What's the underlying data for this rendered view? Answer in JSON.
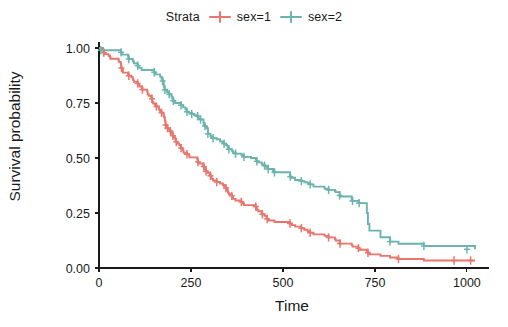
{
  "legend": {
    "title": "Strata",
    "entries": [
      {
        "label": "sex=1",
        "color": "#e8766d",
        "key_icon": "censor-plus-icon"
      },
      {
        "label": "sex=2",
        "color": "#6bb4ad",
        "key_icon": "censor-plus-icon"
      }
    ]
  },
  "axes": {
    "x_title": "Time",
    "y_title": "Survival probability",
    "x_ticks": [
      "0",
      "250",
      "500",
      "750",
      "1000"
    ],
    "y_ticks": [
      "0.00",
      "0.25",
      "0.50",
      "0.75",
      "1.00"
    ]
  },
  "chart_data": {
    "type": "line",
    "title": "",
    "subtitle": "",
    "xlabel": "Time",
    "ylabel": "Survival probability",
    "xlim": [
      0,
      1060
    ],
    "ylim": [
      0.0,
      1.0
    ],
    "x_ticks": [
      0,
      250,
      500,
      750,
      1000
    ],
    "y_ticks": [
      0.0,
      0.25,
      0.5,
      0.75,
      1.0
    ],
    "grid": false,
    "legend_position": "top",
    "legend_title": "Strata",
    "step_type": "post",
    "series": [
      {
        "name": "sex=1",
        "color": "#e8766d",
        "points": [
          [
            0,
            1.0
          ],
          [
            11,
            0.993
          ],
          [
            12,
            0.986
          ],
          [
            13,
            0.979
          ],
          [
            15,
            0.972
          ],
          [
            26,
            0.965
          ],
          [
            30,
            0.958
          ],
          [
            31,
            0.951
          ],
          [
            53,
            0.944
          ],
          [
            54,
            0.937
          ],
          [
            59,
            0.93
          ],
          [
            60,
            0.916
          ],
          [
            61,
            0.909
          ],
          [
            62,
            0.902
          ],
          [
            65,
            0.888
          ],
          [
            79,
            0.881
          ],
          [
            81,
            0.874
          ],
          [
            88,
            0.867
          ],
          [
            92,
            0.86
          ],
          [
            93,
            0.853
          ],
          [
            95,
            0.846
          ],
          [
            105,
            0.839
          ],
          [
            107,
            0.832
          ],
          [
            110,
            0.825
          ],
          [
            116,
            0.818
          ],
          [
            118,
            0.811
          ],
          [
            131,
            0.804
          ],
          [
            132,
            0.79
          ],
          [
            135,
            0.783
          ],
          [
            142,
            0.776
          ],
          [
            144,
            0.769
          ],
          [
            145,
            0.755
          ],
          [
            147,
            0.748
          ],
          [
            153,
            0.741
          ],
          [
            156,
            0.734
          ],
          [
            163,
            0.72
          ],
          [
            166,
            0.713
          ],
          [
            170,
            0.706
          ],
          [
            175,
            0.699
          ],
          [
            176,
            0.692
          ],
          [
            177,
            0.685
          ],
          [
            179,
            0.671
          ],
          [
            180,
            0.664
          ],
          [
            181,
            0.65
          ],
          [
            183,
            0.643
          ],
          [
            186,
            0.636
          ],
          [
            189,
            0.629
          ],
          [
            194,
            0.622
          ],
          [
            197,
            0.615
          ],
          [
            199,
            0.608
          ],
          [
            201,
            0.601
          ],
          [
            202,
            0.594
          ],
          [
            207,
            0.587
          ],
          [
            208,
            0.58
          ],
          [
            210,
            0.573
          ],
          [
            212,
            0.566
          ],
          [
            218,
            0.559
          ],
          [
            222,
            0.552
          ],
          [
            223,
            0.545
          ],
          [
            226,
            0.538
          ],
          [
            229,
            0.531
          ],
          [
            230,
            0.524
          ],
          [
            239,
            0.517
          ],
          [
            245,
            0.51
          ],
          [
            246,
            0.503
          ],
          [
            267,
            0.496
          ],
          [
            268,
            0.489
          ],
          [
            269,
            0.482
          ],
          [
            270,
            0.475
          ],
          [
            283,
            0.468
          ],
          [
            285,
            0.461
          ],
          [
            286,
            0.454
          ],
          [
            288,
            0.447
          ],
          [
            291,
            0.44
          ],
          [
            293,
            0.433
          ],
          [
            301,
            0.426
          ],
          [
            303,
            0.419
          ],
          [
            305,
            0.412
          ],
          [
            306,
            0.405
          ],
          [
            310,
            0.398
          ],
          [
            320,
            0.391
          ],
          [
            329,
            0.384
          ],
          [
            337,
            0.377
          ],
          [
            340,
            0.37
          ],
          [
            345,
            0.363
          ],
          [
            348,
            0.356
          ],
          [
            350,
            0.349
          ],
          [
            351,
            0.342
          ],
          [
            353,
            0.335
          ],
          [
            361,
            0.328
          ],
          [
            363,
            0.321
          ],
          [
            364,
            0.314
          ],
          [
            371,
            0.307
          ],
          [
            387,
            0.3
          ],
          [
            390,
            0.293
          ],
          [
            394,
            0.286
          ],
          [
            426,
            0.279
          ],
          [
            428,
            0.272
          ],
          [
            429,
            0.265
          ],
          [
            433,
            0.258
          ],
          [
            442,
            0.251
          ],
          [
            444,
            0.244
          ],
          [
            450,
            0.237
          ],
          [
            455,
            0.23
          ],
          [
            457,
            0.223
          ],
          [
            460,
            0.216
          ],
          [
            477,
            0.209
          ],
          [
            519,
            0.202
          ],
          [
            524,
            0.195
          ],
          [
            533,
            0.188
          ],
          [
            550,
            0.181
          ],
          [
            558,
            0.174
          ],
          [
            567,
            0.167
          ],
          [
            574,
            0.16
          ],
          [
            583,
            0.153
          ],
          [
            613,
            0.146
          ],
          [
            624,
            0.139
          ],
          [
            641,
            0.132
          ],
          [
            643,
            0.125
          ],
          [
            654,
            0.118
          ],
          [
            655,
            0.111
          ],
          [
            687,
            0.104
          ],
          [
            689,
            0.097
          ],
          [
            705,
            0.09
          ],
          [
            707,
            0.083
          ],
          [
            728,
            0.076
          ],
          [
            731,
            0.069
          ],
          [
            735,
            0.062
          ],
          [
            765,
            0.055
          ],
          [
            791,
            0.048
          ],
          [
            814,
            0.041
          ],
          [
            883,
            0.034
          ],
          [
            1022,
            0.034
          ]
        ],
        "censor_points": [
          [
            13,
            0.979
          ],
          [
            61,
            0.909
          ],
          [
            81,
            0.874
          ],
          [
            105,
            0.839
          ],
          [
            118,
            0.811
          ],
          [
            144,
            0.769
          ],
          [
            156,
            0.734
          ],
          [
            170,
            0.706
          ],
          [
            181,
            0.65
          ],
          [
            186,
            0.636
          ],
          [
            194,
            0.622
          ],
          [
            201,
            0.601
          ],
          [
            210,
            0.573
          ],
          [
            223,
            0.545
          ],
          [
            239,
            0.517
          ],
          [
            269,
            0.482
          ],
          [
            285,
            0.461
          ],
          [
            291,
            0.44
          ],
          [
            303,
            0.419
          ],
          [
            320,
            0.391
          ],
          [
            345,
            0.363
          ],
          [
            361,
            0.328
          ],
          [
            387,
            0.3
          ],
          [
            426,
            0.279
          ],
          [
            444,
            0.244
          ],
          [
            457,
            0.223
          ],
          [
            519,
            0.202
          ],
          [
            550,
            0.181
          ],
          [
            574,
            0.16
          ],
          [
            624,
            0.139
          ],
          [
            655,
            0.111
          ],
          [
            705,
            0.09
          ],
          [
            731,
            0.069
          ],
          [
            814,
            0.041
          ],
          [
            965,
            0.034
          ],
          [
            1010,
            0.034
          ]
        ]
      },
      {
        "name": "sex=2",
        "color": "#6bb4ad",
        "points": [
          [
            0,
            1.0
          ],
          [
            5,
            0.99
          ],
          [
            60,
            0.98
          ],
          [
            61,
            0.98
          ],
          [
            62,
            0.97
          ],
          [
            79,
            0.96
          ],
          [
            81,
            0.95
          ],
          [
            92,
            0.94
          ],
          [
            95,
            0.93
          ],
          [
            105,
            0.92
          ],
          [
            107,
            0.91
          ],
          [
            116,
            0.9
          ],
          [
            150,
            0.89
          ],
          [
            153,
            0.88
          ],
          [
            166,
            0.87
          ],
          [
            170,
            0.86
          ],
          [
            173,
            0.85
          ],
          [
            175,
            0.84
          ],
          [
            176,
            0.83
          ],
          [
            177,
            0.82
          ],
          [
            179,
            0.81
          ],
          [
            185,
            0.8
          ],
          [
            191,
            0.79
          ],
          [
            197,
            0.78
          ],
          [
            199,
            0.77
          ],
          [
            202,
            0.76
          ],
          [
            207,
            0.75
          ],
          [
            223,
            0.74
          ],
          [
            229,
            0.73
          ],
          [
            235,
            0.72
          ],
          [
            239,
            0.71
          ],
          [
            245,
            0.705
          ],
          [
            252,
            0.7
          ],
          [
            259,
            0.695
          ],
          [
            268,
            0.69
          ],
          [
            269,
            0.685
          ],
          [
            270,
            0.68
          ],
          [
            276,
            0.675
          ],
          [
            284,
            0.66
          ],
          [
            285,
            0.65
          ],
          [
            288,
            0.645
          ],
          [
            291,
            0.64
          ],
          [
            293,
            0.635
          ],
          [
            296,
            0.61
          ],
          [
            303,
            0.6
          ],
          [
            305,
            0.595
          ],
          [
            310,
            0.59
          ],
          [
            320,
            0.585
          ],
          [
            329,
            0.575
          ],
          [
            337,
            0.57
          ],
          [
            340,
            0.565
          ],
          [
            345,
            0.56
          ],
          [
            348,
            0.555
          ],
          [
            350,
            0.55
          ],
          [
            351,
            0.545
          ],
          [
            353,
            0.54
          ],
          [
            361,
            0.535
          ],
          [
            363,
            0.53
          ],
          [
            364,
            0.525
          ],
          [
            371,
            0.52
          ],
          [
            387,
            0.515
          ],
          [
            390,
            0.51
          ],
          [
            394,
            0.505
          ],
          [
            413,
            0.5
          ],
          [
            426,
            0.495
          ],
          [
            428,
            0.49
          ],
          [
            429,
            0.485
          ],
          [
            433,
            0.48
          ],
          [
            442,
            0.475
          ],
          [
            444,
            0.47
          ],
          [
            450,
            0.465
          ],
          [
            455,
            0.46
          ],
          [
            457,
            0.455
          ],
          [
            460,
            0.45
          ],
          [
            473,
            0.44
          ],
          [
            477,
            0.435
          ],
          [
            519,
            0.42
          ],
          [
            520,
            0.415
          ],
          [
            524,
            0.41
          ],
          [
            533,
            0.4
          ],
          [
            550,
            0.395
          ],
          [
            558,
            0.39
          ],
          [
            567,
            0.385
          ],
          [
            574,
            0.38
          ],
          [
            583,
            0.37
          ],
          [
            613,
            0.36
          ],
          [
            624,
            0.355
          ],
          [
            641,
            0.35
          ],
          [
            643,
            0.345
          ],
          [
            654,
            0.33
          ],
          [
            655,
            0.325
          ],
          [
            687,
            0.31
          ],
          [
            689,
            0.305
          ],
          [
            705,
            0.3
          ],
          [
            707,
            0.295
          ],
          [
            728,
            0.25
          ],
          [
            731,
            0.2
          ],
          [
            735,
            0.17
          ],
          [
            765,
            0.14
          ],
          [
            791,
            0.12
          ],
          [
            814,
            0.11
          ],
          [
            883,
            0.1
          ],
          [
            1022,
            0.085
          ]
        ],
        "censor_points": [
          [
            5,
            0.99
          ],
          [
            60,
            0.98
          ],
          [
            81,
            0.95
          ],
          [
            105,
            0.92
          ],
          [
            150,
            0.89
          ],
          [
            173,
            0.85
          ],
          [
            179,
            0.81
          ],
          [
            191,
            0.79
          ],
          [
            202,
            0.76
          ],
          [
            223,
            0.74
          ],
          [
            239,
            0.71
          ],
          [
            252,
            0.7
          ],
          [
            268,
            0.69
          ],
          [
            276,
            0.675
          ],
          [
            288,
            0.645
          ],
          [
            296,
            0.61
          ],
          [
            310,
            0.59
          ],
          [
            340,
            0.565
          ],
          [
            353,
            0.54
          ],
          [
            371,
            0.52
          ],
          [
            394,
            0.505
          ],
          [
            429,
            0.485
          ],
          [
            450,
            0.465
          ],
          [
            460,
            0.45
          ],
          [
            477,
            0.435
          ],
          [
            520,
            0.415
          ],
          [
            550,
            0.395
          ],
          [
            574,
            0.38
          ],
          [
            624,
            0.355
          ],
          [
            654,
            0.33
          ],
          [
            689,
            0.305
          ],
          [
            707,
            0.295
          ],
          [
            791,
            0.12
          ],
          [
            883,
            0.1
          ],
          [
            1000,
            0.085
          ]
        ]
      }
    ]
  }
}
